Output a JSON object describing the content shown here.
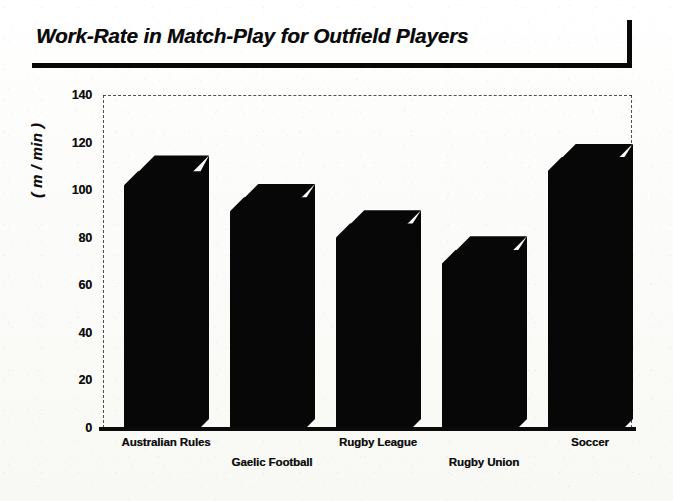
{
  "title": {
    "text": "Work-Rate in Match-Play for Outfield Players"
  },
  "chart_data": {
    "type": "bar",
    "title": "Work-Rate in Match-Play for Outfield Players",
    "xlabel": "",
    "ylabel": "( m / min )",
    "categories": [
      "Australian Rules",
      "Gaelic Football",
      "Rugby League",
      "Rugby Union",
      "Soccer"
    ],
    "values": [
      108,
      97,
      86,
      75,
      114
    ],
    "values_back_edge": [
      115,
      103,
      92,
      81,
      120
    ],
    "ylim": [
      0,
      140
    ],
    "ytick_step": 20,
    "yticks": [
      0,
      20,
      40,
      60,
      80,
      100,
      120,
      140
    ],
    "ytick_labels": [
      "0",
      "20",
      "40",
      "60",
      "80",
      "100",
      "120",
      "140"
    ],
    "grid": false,
    "legend": null,
    "bar_color": "#070707",
    "style": "pseudo-3d-extruded",
    "label_layout": "staggered-two-rows"
  },
  "colors": {
    "ink": "#0a0a0a",
    "paper": "#fbfbf9",
    "bar": "#070707",
    "frame": "#2a2a2a"
  }
}
